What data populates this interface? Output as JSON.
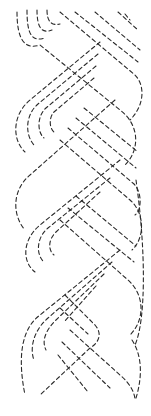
{
  "image": {
    "subject": "braided cable quilting stencil",
    "line_style": "dashed",
    "line_color": "#2a2a2a",
    "background_color": "#ffffff",
    "strands_per_band": 4,
    "crossings": 5
  }
}
